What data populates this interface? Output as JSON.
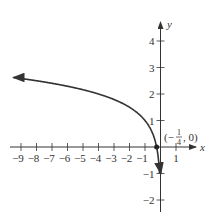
{
  "chart_data": {
    "type": "line",
    "title": "",
    "xlabel": "x",
    "ylabel": "y",
    "xlim": [
      -9.6,
      1.8
    ],
    "ylim": [
      -2.4,
      4.6
    ],
    "x_ticks": [
      -9,
      -8,
      -7,
      -6,
      -5,
      -4,
      -3,
      -2,
      -1,
      1
    ],
    "y_ticks": [
      -2,
      -1,
      1,
      2,
      3,
      4
    ],
    "x_tick_labels": [
      "−9",
      "−8",
      "−7",
      "−6",
      "−5",
      "−4",
      "−3",
      "−2",
      "−1",
      "1"
    ],
    "y_tick_labels": [
      "−2",
      "−1",
      "1",
      "2",
      "3",
      "4"
    ],
    "grid": false,
    "series": [
      {
        "name": "f(x) = log4(-4x)",
        "x": [
          -9.5,
          -9,
          -8,
          -7,
          -6,
          -5,
          -4,
          -3,
          -2,
          -1,
          -0.5,
          -0.25,
          -0.0625
        ],
        "values": [
          2.62,
          2.58,
          2.5,
          2.4,
          2.29,
          2.16,
          2.0,
          1.79,
          1.5,
          1.0,
          0.5,
          0.0,
          -1.0
        ]
      }
    ],
    "annotations": [
      {
        "text": "(−1/4, 0)",
        "x": -0.25,
        "y": 0
      }
    ]
  },
  "labels": {
    "x_axis": "x",
    "y_axis": "y",
    "point_open": "(−",
    "point_num": "1",
    "point_den": "4",
    "point_close": ", 0)"
  }
}
